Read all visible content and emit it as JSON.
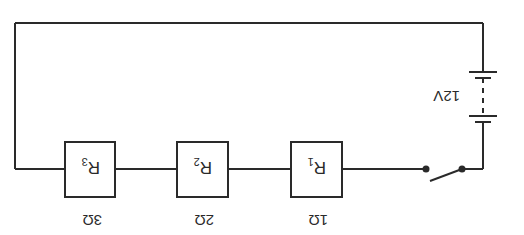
{
  "diagram": {
    "type": "series-circuit",
    "orientation": "rotated-180",
    "colors": {
      "line": "#2a2a2a",
      "background": "#ffffff"
    },
    "battery": {
      "label": "12V"
    },
    "switch": {
      "state": "open"
    },
    "resistors": [
      {
        "id": "R1",
        "name": "R",
        "subscript": "1",
        "value": "1Ω"
      },
      {
        "id": "R2",
        "name": "R",
        "subscript": "2",
        "value": "2Ω"
      },
      {
        "id": "R3",
        "name": "R",
        "subscript": "3",
        "value": "3Ω"
      }
    ]
  }
}
